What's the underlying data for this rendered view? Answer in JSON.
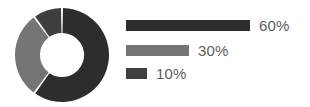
{
  "chart_data": {
    "type": "pie",
    "title": "",
    "subtitle": "",
    "variant": "donut",
    "categories": [
      "Series 1",
      "Series 2",
      "Series 3"
    ],
    "values": [
      60,
      30,
      10
    ],
    "labels": [
      "60%",
      "30%",
      "10%"
    ],
    "colors": [
      "#2d2d2d",
      "#757575",
      "#3f3f3f"
    ],
    "unit": "%",
    "start_angle_deg": 0,
    "direction": "clockwise",
    "inner_radius_ratio": 0.47,
    "gap_deg": 2.5,
    "grid": false,
    "legend": {
      "position": "right",
      "style": "proportional-bars",
      "max_bar_px": 124,
      "entries": [
        {
          "label": "60%",
          "value": 60,
          "color": "#2d2d2d",
          "bar_px": 124
        },
        {
          "label": "30%",
          "value": 30,
          "color": "#757575",
          "bar_px": 63
        },
        {
          "label": "10%",
          "value": 10,
          "color": "#3f3f3f",
          "bar_px": 21
        }
      ]
    },
    "background": "#ffffff",
    "text_color": "#5c5c5c"
  }
}
